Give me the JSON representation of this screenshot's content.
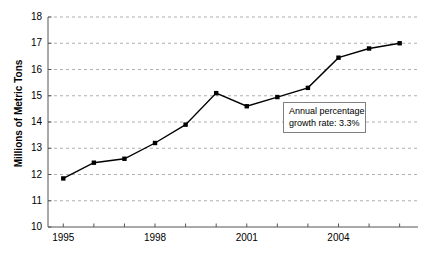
{
  "chart_data": {
    "type": "line",
    "title": "",
    "xlabel": "",
    "ylabel": "Millions of Metric Tons",
    "x": [
      1995,
      1996,
      1997,
      1998,
      1999,
      2000,
      2001,
      2002,
      2003,
      2004,
      2005,
      2006
    ],
    "values": [
      11.85,
      12.45,
      12.6,
      13.2,
      13.9,
      15.1,
      14.6,
      14.95,
      15.3,
      16.45,
      16.8,
      17.0
    ],
    "xlim": [
      1994.5,
      2006.6
    ],
    "ylim": [
      10,
      18
    ],
    "ytick_labels": [
      "10",
      "11",
      "12",
      "13",
      "14",
      "15",
      "16",
      "17",
      "18"
    ],
    "ytick_values": [
      10,
      11,
      12,
      13,
      14,
      15,
      16,
      17,
      18
    ],
    "xtick_values": [
      1995,
      1996,
      1997,
      1998,
      1999,
      2000,
      2001,
      2002,
      2003,
      2004,
      2005,
      2006
    ],
    "xtick_labels_shown": [
      {
        "value": 1995,
        "label": "1995"
      },
      {
        "value": 1998,
        "label": "1998"
      },
      {
        "value": 2001,
        "label": "2001"
      },
      {
        "value": 2004,
        "label": "2004"
      }
    ],
    "grid": "horizontal-dashed",
    "legend": "none",
    "series_color": "#000000",
    "marker": "filled-square",
    "annotations": [
      {
        "text_line1": "Annual percentage",
        "text_line2": "growth rate: 3.3%",
        "full_text": "Annual percentage growth rate: 3.3%"
      }
    ]
  },
  "axes": {
    "y_axis_title": "Millions of Metric Tons"
  }
}
